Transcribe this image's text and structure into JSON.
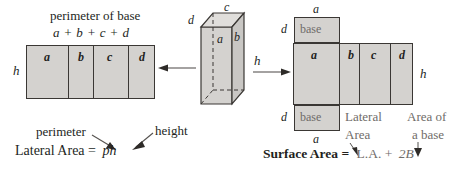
{
  "figure": {
    "title_top_left": "perimeter of base",
    "formula_top_left": "a + b + c + d",
    "left_net": {
      "height_label": "h",
      "face_labels": [
        "a",
        "b",
        "c",
        "d"
      ]
    },
    "prism": {
      "top_edge_label": "c",
      "left_edge_label": "d",
      "right_edge_label": "b",
      "inner_edge_label": "a",
      "height_label": "h"
    },
    "right_net": {
      "top_base_label": "a",
      "top_side_label": "d",
      "bottom_base_label": "a",
      "bottom_side_label": "d",
      "base_text": "base",
      "face_labels": [
        "a",
        "b",
        "c",
        "d"
      ],
      "height_label": "h"
    },
    "callouts": {
      "perimeter": "perimeter",
      "height": "height",
      "lateral_area_line1": "Lateral",
      "lateral_area_line2": "Area",
      "area_of_line1": "Area of",
      "area_of_line2": "a base"
    },
    "equations": {
      "lateral_area_label": "Lateral Area =",
      "lateral_area_value": "ph",
      "surface_area_label": "Surface Area =",
      "surface_area_la": "L.A. +",
      "surface_area_2b": "2B"
    }
  },
  "colors": {
    "fill": "#d4d2cf",
    "stroke": "#3a3734",
    "text": "#231f1d",
    "muted": "#6f6c69"
  }
}
